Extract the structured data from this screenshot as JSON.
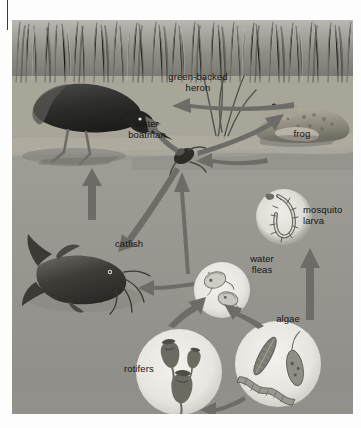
{
  "figure": {
    "background_color": "#9a9a93",
    "water_color": "#9d9d96",
    "sediment_color": "#b6b2a6",
    "reeds_color": "#8d8c85",
    "arrow_color": "#6f6f69",
    "circle_color": "#e8e8e2",
    "label_color": "#151515"
  },
  "labels": {
    "green_backed_heron": "green-backed\nheron",
    "water_boatman": "water\nboatman",
    "frog": "frog",
    "mosquito_larva": "mosquito\nlarva",
    "catfish": "catfish",
    "water_fleas": "water\nfleas",
    "rotifers": "rotifers",
    "algae": "algae"
  },
  "organisms": [
    {
      "id": "green-backed-heron",
      "label": "green-backed heron",
      "kind": "bird",
      "depicted_as": "dark wading bird with long beak standing in shallows"
    },
    {
      "id": "frog",
      "label": "frog",
      "kind": "amphibian",
      "depicted_as": "spotted frog sitting on bank among reeds"
    },
    {
      "id": "water-boatman",
      "label": "water boatman",
      "kind": "insect",
      "depicted_as": "oval aquatic bug with oar-like legs at water surface"
    },
    {
      "id": "mosquito-larva",
      "label": "mosquito larva",
      "kind": "insect-larva",
      "depicted_as": "segmented wriggler inside a pale circular inset"
    },
    {
      "id": "catfish",
      "label": "catfish",
      "kind": "fish",
      "depicted_as": "dark barbelled fish near pond bottom"
    },
    {
      "id": "water-fleas",
      "label": "water fleas",
      "kind": "zooplankton",
      "depicted_as": "two daphnia inside a pale circular inset"
    },
    {
      "id": "rotifers",
      "label": "rotifers",
      "kind": "zooplankton",
      "depicted_as": "three vase-shaped rotifers inside a pale circular inset"
    },
    {
      "id": "algae",
      "label": "algae",
      "kind": "producer",
      "depicted_as": "diatoms and filamentous algae inside a pale circular inset"
    }
  ],
  "arrows": [
    {
      "from": "frog",
      "to": "green-backed-heron",
      "meaning": "energy flows from frog to heron"
    },
    {
      "from": "water-boatman",
      "to": "green-backed-heron",
      "meaning": "energy flows from water boatman to heron"
    },
    {
      "from": "water-boatman",
      "to": "frog",
      "meaning": "energy flows from water boatman to frog"
    },
    {
      "from": "mosquito-larva",
      "to": "water-boatman",
      "meaning": "energy flows from mosquito larva to water boatman"
    },
    {
      "from": "water-fleas",
      "to": "water-boatman",
      "meaning": "energy flows from water fleas to water boatman"
    },
    {
      "from": "water-boatman",
      "to": "catfish",
      "meaning": "energy flows from water boatman to catfish"
    },
    {
      "from": "water-fleas",
      "to": "catfish",
      "meaning": "energy flows from water fleas to catfish"
    },
    {
      "from": "rotifers",
      "to": "water-fleas",
      "meaning": "energy flows from rotifers to water fleas"
    },
    {
      "from": "algae",
      "to": "water-fleas",
      "meaning": "energy flows from algae to water fleas"
    },
    {
      "from": "algae",
      "to": "rotifers",
      "meaning": "energy flows from algae to rotifers"
    },
    {
      "from": "algae",
      "to": "mosquito-larva",
      "meaning": "energy flows from algae up to mosquito larva"
    }
  ]
}
